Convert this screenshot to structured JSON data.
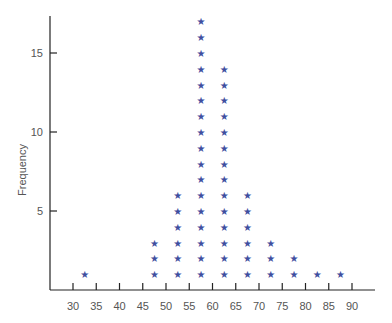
{
  "chart_data": {
    "type": "dot-plot",
    "title": "",
    "xlabel": "",
    "ylabel": "Frequency",
    "marker": "*",
    "marker_color": "#3f4fa0",
    "xlim": [
      25,
      95
    ],
    "ylim": [
      0,
      17
    ],
    "x_ticks": [
      30,
      35,
      40,
      45,
      50,
      55,
      60,
      65,
      70,
      75,
      80,
      85,
      90
    ],
    "y_ticks": [
      5,
      10,
      15
    ],
    "grid": false,
    "categories": [
      32.5,
      37.5,
      42.5,
      47.5,
      52.5,
      57.5,
      62.5,
      67.5,
      72.5,
      77.5,
      82.5,
      87.5
    ],
    "values": [
      1,
      0,
      0,
      3,
      6,
      17,
      14,
      6,
      3,
      2,
      1,
      1
    ]
  }
}
